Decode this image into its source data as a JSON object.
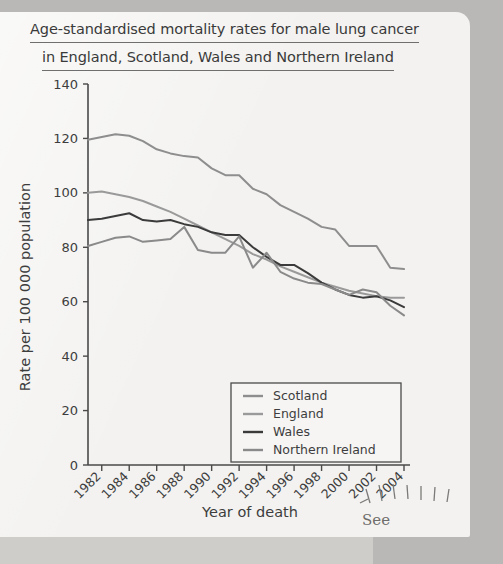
{
  "page": {
    "background_color": "#b9b8b6",
    "paper_color": "#f3f2f0"
  },
  "annotation": {
    "pencil_text": "See"
  },
  "chart_data": {
    "type": "line",
    "title_line1": "Age-standardised mortality rates for male lung cancer",
    "title_line2": "in England, Scotland, Wales and Northern Ireland",
    "title": "Age-standardised mortality rates for male lung cancer in England, Scotland, Wales and Northern Ireland",
    "xlabel": "Year of death",
    "ylabel": "Rate per 100 000 population",
    "xlim": [
      1981,
      2004
    ],
    "ylim": [
      0,
      140
    ],
    "ytick_values": [
      0,
      20,
      40,
      60,
      80,
      100,
      120,
      140
    ],
    "ytick_labels": [
      "0",
      "20",
      "40",
      "60",
      "80",
      "100",
      "120",
      "140"
    ],
    "xtick_values": [
      1982,
      1984,
      1986,
      1988,
      1990,
      1992,
      1994,
      1996,
      1998,
      2000,
      2002,
      2004
    ],
    "xtick_labels": [
      "1982",
      "1984",
      "1986",
      "1988",
      "1990",
      "1992",
      "1994",
      "1996",
      "1998",
      "2000",
      "2002",
      "2004"
    ],
    "grid": false,
    "legend_position": "lower-center",
    "x": [
      1981,
      1982,
      1983,
      1984,
      1985,
      1986,
      1987,
      1988,
      1989,
      1990,
      1991,
      1992,
      1993,
      1994,
      1995,
      1996,
      1997,
      1998,
      1999,
      2000,
      2001,
      2002,
      2003,
      2004
    ],
    "series": [
      {
        "name": "Scotland",
        "color": "#8e8e8e",
        "values": [
          119.5,
          120.5,
          121.5,
          121.0,
          119.0,
          116.0,
          114.5,
          113.5,
          113.0,
          109.0,
          106.5,
          106.5,
          101.5,
          99.5,
          95.5,
          93.0,
          90.5,
          87.5,
          86.5,
          80.5,
          80.5,
          80.5,
          72.5,
          72.0
        ]
      },
      {
        "name": "England",
        "color": "#9a9a9a",
        "values": [
          100.0,
          100.5,
          99.5,
          98.5,
          97.0,
          95.0,
          93.0,
          90.5,
          88.0,
          85.5,
          83.0,
          80.5,
          77.5,
          75.5,
          73.0,
          71.0,
          69.0,
          67.0,
          65.5,
          64.0,
          63.0,
          62.0,
          61.5,
          61.5
        ]
      },
      {
        "name": "Wales",
        "color": "#3b3b3b",
        "values": [
          90.0,
          90.5,
          91.5,
          92.5,
          90.0,
          89.5,
          90.0,
          88.5,
          87.5,
          85.5,
          84.5,
          84.5,
          80.0,
          76.5,
          73.5,
          73.5,
          70.5,
          67.0,
          64.5,
          62.5,
          61.5,
          62.0,
          60.5,
          58.0
        ]
      },
      {
        "name": "Northern Ireland",
        "color": "#8a8a8a",
        "values": [
          80.5,
          82.0,
          83.5,
          84.0,
          82.0,
          82.5,
          83.0,
          87.5,
          79.0,
          78.0,
          78.0,
          84.0,
          72.5,
          78.0,
          71.0,
          68.5,
          67.0,
          66.5,
          64.5,
          62.5,
          64.5,
          63.5,
          58.5,
          55.0
        ]
      }
    ],
    "legend": [
      {
        "label": "Scotland",
        "color": "#8e8e8e"
      },
      {
        "label": "England",
        "color": "#9a9a9a"
      },
      {
        "label": "Wales",
        "color": "#3b3b3b"
      },
      {
        "label": "Northern Ireland",
        "color": "#8a8a8a"
      }
    ]
  }
}
